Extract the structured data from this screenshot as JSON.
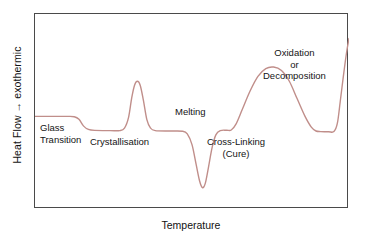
{
  "figure": {
    "title": "",
    "axis": {
      "ylabel": "Heat Flow → exothermic",
      "xlabel": "Temperature"
    },
    "annotations": {
      "glass_transition": "Glass\nTransition",
      "crystallisation": "Crystallisation",
      "melting": "Melting",
      "cross_linking": "Cross-Linking\n(Cure)",
      "oxidation": "Oxidation\nor\nDecomposition"
    },
    "colors": {
      "curve": "#c08e8a",
      "frame": "#4a4a4a",
      "text": "#141414",
      "background": "#ffffff"
    }
  },
  "chart_data": {
    "type": "line",
    "xlabel": "Temperature",
    "ylabel": "Heat Flow → exothermic",
    "xlim": [
      0,
      100
    ],
    "ylim": [
      0,
      100
    ],
    "grid": false,
    "legend": null,
    "axis_ticks": {
      "x": [],
      "y": []
    },
    "series": [
      {
        "name": "Heat flow",
        "color": "#c08e8a",
        "comment": "x,y in percent of plot box; y measured upward from plot bottom",
        "points": [
          [
            0.0,
            47.5
          ],
          [
            10.0,
            47.5
          ],
          [
            12.5,
            47.3
          ],
          [
            14.0,
            46.0
          ],
          [
            15.5,
            42.5
          ],
          [
            17.0,
            40.8
          ],
          [
            19.0,
            40.3
          ],
          [
            24.0,
            40.2
          ],
          [
            27.0,
            40.2
          ],
          [
            28.5,
            41.5
          ],
          [
            29.8,
            47.0
          ],
          [
            30.8,
            57.0
          ],
          [
            31.7,
            63.5
          ],
          [
            32.6,
            65.5
          ],
          [
            33.5,
            63.5
          ],
          [
            34.5,
            56.0
          ],
          [
            35.6,
            46.0
          ],
          [
            36.8,
            41.5
          ],
          [
            38.3,
            40.2
          ],
          [
            43.0,
            40.0
          ],
          [
            47.0,
            39.9
          ],
          [
            48.5,
            38.5
          ],
          [
            50.0,
            33.0
          ],
          [
            51.3,
            23.0
          ],
          [
            52.4,
            14.5
          ],
          [
            53.3,
            11.0
          ],
          [
            54.2,
            13.0
          ],
          [
            55.2,
            21.0
          ],
          [
            56.4,
            31.5
          ],
          [
            57.6,
            38.0
          ],
          [
            59.0,
            40.2
          ],
          [
            61.0,
            40.4
          ],
          [
            62.5,
            40.5
          ],
          [
            64.0,
            43.5
          ],
          [
            66.0,
            51.0
          ],
          [
            68.5,
            60.5
          ],
          [
            71.0,
            68.0
          ],
          [
            73.5,
            72.0
          ],
          [
            76.0,
            72.8
          ],
          [
            78.5,
            71.0
          ],
          [
            81.0,
            65.5
          ],
          [
            83.5,
            56.5
          ],
          [
            86.0,
            47.5
          ],
          [
            88.0,
            42.0
          ],
          [
            89.5,
            40.0
          ],
          [
            91.0,
            39.7
          ],
          [
            93.5,
            39.6
          ],
          [
            95.2,
            39.7
          ],
          [
            96.3,
            44.0
          ],
          [
            97.2,
            55.0
          ],
          [
            98.2,
            68.0
          ],
          [
            99.2,
            80.0
          ],
          [
            100.0,
            87.5
          ]
        ]
      }
    ],
    "annotations": [
      {
        "label": "Glass Transition",
        "x": 4,
        "y": 33,
        "feature": "step-down"
      },
      {
        "label": "Crystallisation",
        "x": 32,
        "y": 26,
        "feature": "exothermic-peak"
      },
      {
        "label": "Melting",
        "x": 53,
        "y": 54,
        "feature": "endothermic-valley"
      },
      {
        "label": "Cross-Linking (Cure)",
        "x": 75,
        "y": 26,
        "feature": "broad-exothermic-peak"
      },
      {
        "label": "Oxidation or Decomposition",
        "x": 90,
        "y": 86,
        "feature": "rising-exotherm"
      }
    ]
  }
}
